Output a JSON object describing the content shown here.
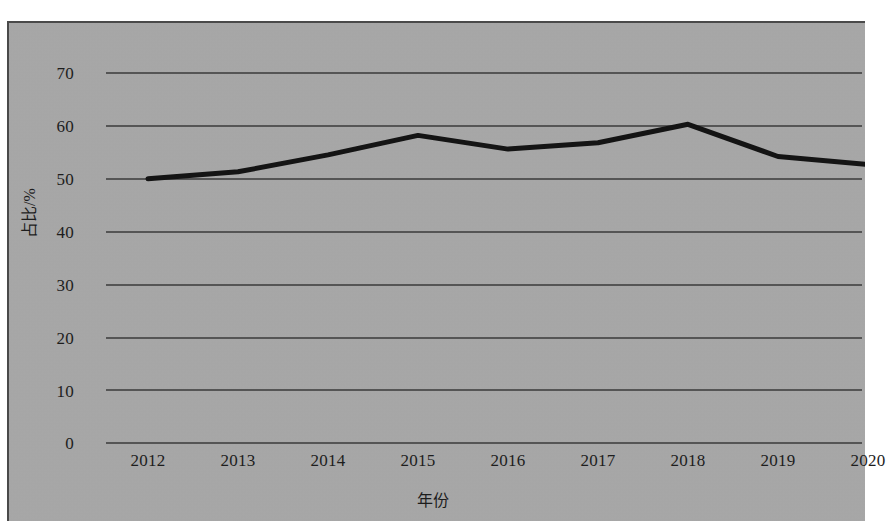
{
  "chart_data": {
    "type": "line",
    "title": "",
    "subtitle": "",
    "xlabel": "年份",
    "ylabel": "占比/%",
    "categories": [
      "2012",
      "2013",
      "2014",
      "2015",
      "2016",
      "2017",
      "2018",
      "2019",
      "2020"
    ],
    "values": [
      50.0,
      51.3,
      54.5,
      58.2,
      55.6,
      56.8,
      60.3,
      54.2,
      52.7
    ],
    "series": [
      {
        "name": "占比",
        "values": [
          50.0,
          51.3,
          54.5,
          58.2,
          55.6,
          56.8,
          60.3,
          54.2,
          52.7
        ]
      }
    ],
    "ylim": [
      0,
      70
    ],
    "y_ticks": [
      "0",
      "10",
      "20",
      "30",
      "40",
      "50",
      "60",
      "70"
    ],
    "y_tick_values": [
      0,
      10,
      20,
      30,
      40,
      50,
      60,
      70
    ],
    "x_ticks": [
      "2012",
      "2013",
      "2014",
      "2015",
      "2016",
      "2017",
      "2018",
      "2019",
      "2020"
    ],
    "grid": "horizontal",
    "legend": "none",
    "markers": "none",
    "line_color": "#141414",
    "line_width": 5,
    "plot_background": "#a8a8a8",
    "gridline_color": "#3a3a3a",
    "text_color": "#1d1d1d"
  },
  "axes": {
    "y_title": "占比/%",
    "x_title": "年份"
  }
}
